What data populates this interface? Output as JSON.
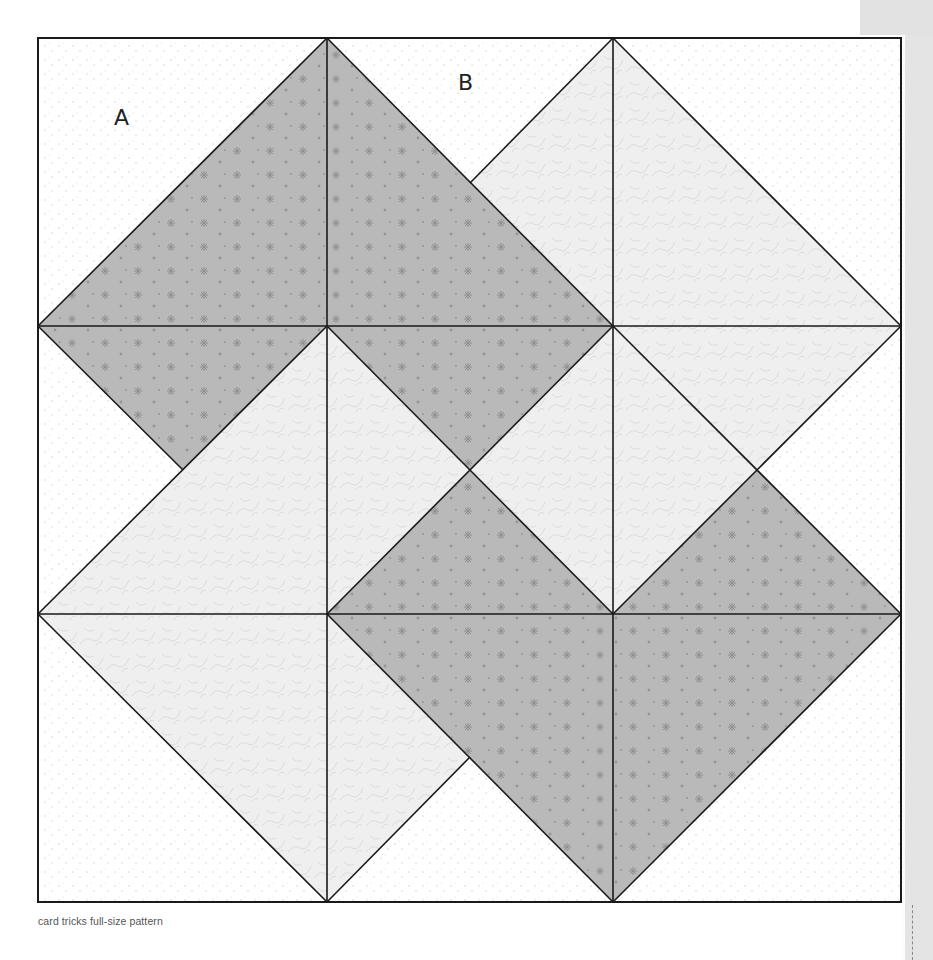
{
  "pattern": {
    "name": "card tricks",
    "caption": "card tricks full-size pattern",
    "labels": [
      {
        "text": "A",
        "x": 116,
        "y": 104
      },
      {
        "text": "B",
        "x": 459,
        "y": 70
      }
    ],
    "grid": {
      "x": [
        38,
        327,
        613,
        901
      ],
      "y": [
        38,
        326,
        614,
        902
      ]
    },
    "colors": {
      "background_texture": "#e0e0e0",
      "paper": "#ffffff",
      "dark_fabric": "#b9b9b9",
      "dark_star": "#8f8f8f",
      "light_fabric": "#efefef",
      "light_vine": "#dcdcdc",
      "white_dot": "#d8d8d8",
      "line": "#1a1a1a",
      "caption": "#555555"
    },
    "pieces": {
      "dark": [
        "38,326 327,38 327,326",
        "327,38 613,326 327,326",
        "38,326 327,326 183,470",
        "327,326 613,326 470,470",
        "470,470 613,614 327,614",
        "613,614 901,614 757,470",
        "327,614 613,614 613,902",
        "613,614 901,614 613,902"
      ],
      "light": [
        "470,183 613,38 613,326",
        "613,38 901,326 613,326",
        "613,326 901,326 757,470 613,614",
        "470,470 613,326 613,614",
        "183,470 327,326 327,614 38,614",
        "327,326 470,470 327,614",
        "38,614 327,614 327,902",
        "327,614 470,757 327,902"
      ]
    }
  }
}
